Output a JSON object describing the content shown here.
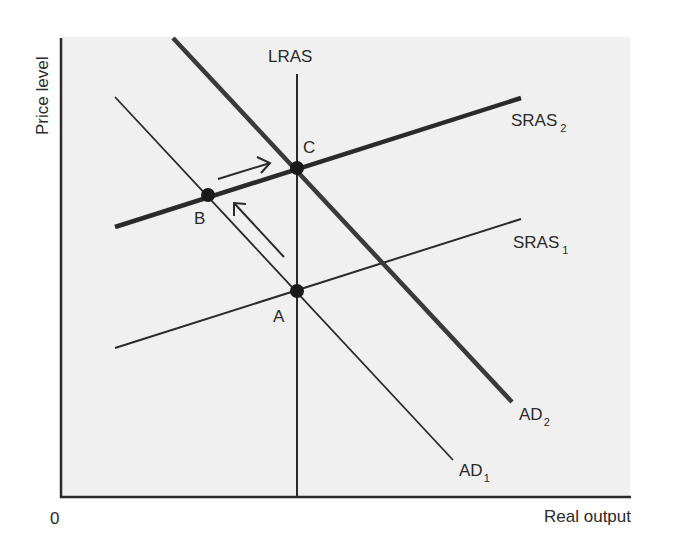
{
  "diagram": {
    "axes": {
      "y_label": "Price level",
      "x_label": "Real output",
      "origin_label": "0"
    },
    "curves": {
      "lras": {
        "label": "LRAS"
      },
      "sras1": {
        "label": "SRAS",
        "subscript": "1"
      },
      "sras2": {
        "label": "SRAS",
        "subscript": "2"
      },
      "ad1": {
        "label": "AD",
        "subscript": "1"
      },
      "ad2": {
        "label": "AD",
        "subscript": "2"
      }
    },
    "points": {
      "a": {
        "label": "A"
      },
      "b": {
        "label": "B"
      },
      "c": {
        "label": "C"
      }
    },
    "arrows": [
      {
        "name": "arrow-a-to-b",
        "direction": "up-left along AD1"
      },
      {
        "name": "arrow-b-to-c",
        "direction": "right along SRAS2"
      }
    ],
    "colors": {
      "panel_background": "#f0f0f0",
      "line": "#2a2a2a",
      "thick_line": "#3a3a3a"
    }
  }
}
